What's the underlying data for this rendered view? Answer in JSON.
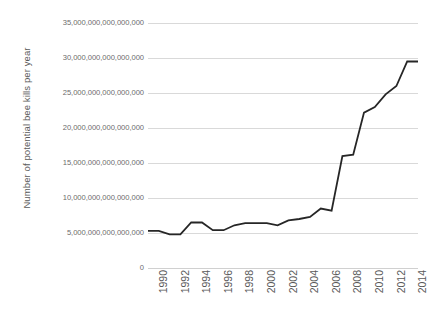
{
  "chart_data": {
    "type": "line",
    "title": "",
    "xlabel": "",
    "ylabel": "Number of potential bee kills per year",
    "x": [
      1990,
      1991,
      1992,
      1993,
      1994,
      1995,
      1996,
      1997,
      1998,
      1999,
      2000,
      2001,
      2002,
      2003,
      2004,
      2005,
      2006,
      2007,
      2008,
      2009,
      2010,
      2011,
      2012,
      2013,
      2014,
      2015
    ],
    "values": [
      5300000000000000,
      5300000000000000,
      4800000000000000,
      4800000000000000,
      6500000000000000,
      6500000000000000,
      5400000000000000,
      5400000000000000,
      6100000000000000,
      6400000000000000,
      6400000000000000,
      6400000000000000,
      6100000000000000,
      6800000000000000,
      7000000000000000,
      7300000000000000,
      8500000000000000,
      8200000000000000,
      16000000000000000,
      16200000000000000,
      22200000000000000,
      23000000000000000,
      24800000000000000,
      26000000000000000,
      29500000000000000,
      29500000000000000
    ],
    "series": [
      {
        "name": "Number of potential bee kills per year",
        "color": "#262626",
        "values": [
          5300000000000000,
          5300000000000000,
          4800000000000000,
          4800000000000000,
          6500000000000000,
          6500000000000000,
          5400000000000000,
          5400000000000000,
          6100000000000000,
          6400000000000000,
          6400000000000000,
          6400000000000000,
          6100000000000000,
          6800000000000000,
          7000000000000000,
          7300000000000000,
          8500000000000000,
          8200000000000000,
          16000000000000000,
          16200000000000000,
          22200000000000000,
          23000000000000000,
          24800000000000000,
          26000000000000000,
          29500000000000000,
          29500000000000000
        ]
      }
    ],
    "ylim": [
      0,
      35000000000000000
    ],
    "xlim": [
      1990,
      2015
    ],
    "ytick_values": [
      0,
      5000000000000000,
      10000000000000000,
      15000000000000000,
      20000000000000000,
      25000000000000000,
      30000000000000000,
      35000000000000000
    ],
    "ytick_labels": [
      "0",
      "5,000,000,000,000,000",
      "10,000,000,000,000,000",
      "15,000,000,000,000,000",
      "20,000,000,000,000,000",
      "25,000,000,000,000,000",
      "30,000,000,000,000,000",
      "35,000,000,000,000,000"
    ],
    "xtick_values": [
      1990,
      1992,
      1994,
      1996,
      1998,
      2000,
      2002,
      2004,
      2006,
      2008,
      2010,
      2012,
      2014
    ],
    "xtick_labels": [
      "1990",
      "1992",
      "1994",
      "1996",
      "1998",
      "2000",
      "2002",
      "2004",
      "2006",
      "2008",
      "2010",
      "2012",
      "2014"
    ],
    "grid": true,
    "grid_axis": "y",
    "grid_color": "#d9d9d9",
    "legend": false,
    "legend_position": "none",
    "background_color": "#ffffff",
    "line_color": "#262626",
    "line_width": 1.8,
    "markers": false,
    "annotations": []
  }
}
